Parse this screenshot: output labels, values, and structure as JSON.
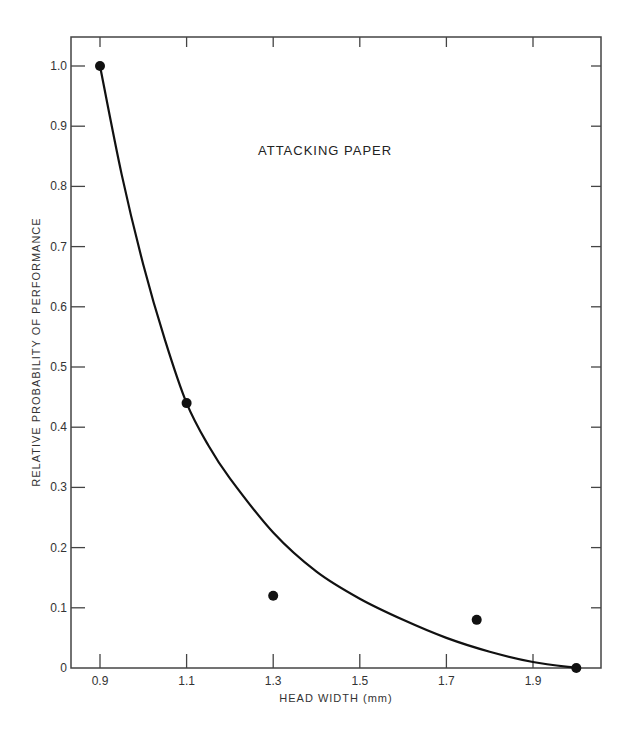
{
  "chart_data": {
    "type": "scatter",
    "title": "",
    "annotation": "ATTACKING PAPER",
    "xlabel": "HEAD WIDTH (mm)",
    "ylabel": "RELATIVE PROBABILITY OF PERFORMANCE",
    "xlim": [
      0.83,
      2.05
    ],
    "ylim": [
      0,
      1.07
    ],
    "x_ticks": [
      0.9,
      1.1,
      1.3,
      1.5,
      1.7,
      1.9
    ],
    "x_tick_labels": [
      "0.9",
      "1.1",
      "1.3",
      "1.5",
      "1.7",
      "1.9"
    ],
    "y_ticks": [
      0,
      0.1,
      0.2,
      0.3,
      0.4,
      0.5,
      0.6,
      0.7,
      0.8,
      0.9,
      1.0
    ],
    "y_tick_labels": [
      "0",
      "0.1",
      "0.2",
      "0.3",
      "0.4",
      "0.5",
      "0.6",
      "0.7",
      "0.8",
      "0.9",
      "1.0"
    ],
    "grid": false,
    "legend": null,
    "series": [
      {
        "name": "observed",
        "kind": "points",
        "x": [
          0.9,
          1.1,
          1.3,
          1.77,
          2.0
        ],
        "y": [
          1.0,
          0.44,
          0.12,
          0.08,
          0.0
        ]
      },
      {
        "name": "fitted curve",
        "kind": "line",
        "x": [
          0.9,
          0.95,
          1.0,
          1.05,
          1.1,
          1.15,
          1.2,
          1.3,
          1.4,
          1.5,
          1.6,
          1.7,
          1.8,
          1.9,
          2.0
        ],
        "y": [
          1.0,
          0.82,
          0.67,
          0.545,
          0.44,
          0.37,
          0.315,
          0.225,
          0.16,
          0.115,
          0.08,
          0.05,
          0.027,
          0.01,
          0.0
        ]
      }
    ]
  },
  "colors": {
    "ink": "#111111",
    "axis": "#444444",
    "background": "#ffffff"
  }
}
